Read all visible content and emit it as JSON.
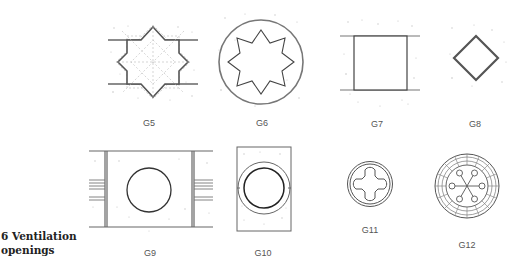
{
  "figure": {
    "caption_number": "6",
    "caption_line1": "6 Ventilation",
    "caption_line2": "openings",
    "panels": [
      {
        "id": "G5",
        "label": "G5",
        "shape": "eight-point-star-in-wall"
      },
      {
        "id": "G6",
        "label": "G6",
        "shape": "eight-point-star-in-circle"
      },
      {
        "id": "G7",
        "label": "G7",
        "shape": "square-opening-in-wall"
      },
      {
        "id": "G8",
        "label": "G8",
        "shape": "diamond"
      },
      {
        "id": "G9",
        "label": "G9",
        "shape": "circle-in-panel-with-beams"
      },
      {
        "id": "G10",
        "label": "G10",
        "shape": "double-ring-in-rectangle"
      },
      {
        "id": "G11",
        "label": "G11",
        "shape": "quatrefoil-in-ring"
      },
      {
        "id": "G12",
        "label": "G12",
        "shape": "wheel-with-spokes"
      }
    ]
  },
  "colors": {
    "line": "#444444",
    "light_line": "#9a9a9a",
    "stipple": "#b8b8b8"
  }
}
